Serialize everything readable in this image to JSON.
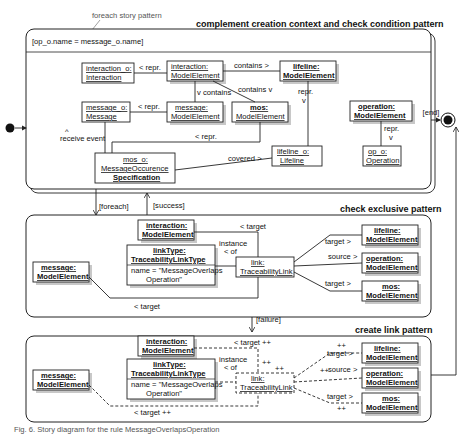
{
  "diagram": {
    "foreach_label": "foreach story pattern",
    "patterns": [
      {
        "id": "complement",
        "title": "complement creation context and check condition pattern",
        "condition": "[op_o.name = message_o.name]"
      },
      {
        "id": "check_exclusive",
        "title": "check exclusive pattern"
      },
      {
        "id": "create_link",
        "title": "create link pattern"
      }
    ],
    "transitions": {
      "foreach": "[foreach]",
      "success": "[success]",
      "failure": "[failure]",
      "end": "[end]"
    },
    "p1": {
      "nodes": {
        "interaction_o": {
          "name": "interaction_o:",
          "type": "Interaction"
        },
        "interaction_me": {
          "name": "interaction:",
          "type": "ModelElement"
        },
        "lifeline_me": {
          "name": "lifeline:",
          "type": "ModelElement"
        },
        "message_o": {
          "name": "message_o:",
          "type": "Message"
        },
        "message_me": {
          "name": "message:",
          "type": "ModelElement"
        },
        "mos_me": {
          "name": "mos:",
          "type": "ModelElement"
        },
        "operation_me": {
          "name": "operation:",
          "type": "ModelElement"
        },
        "op_o": {
          "name": "op_o:",
          "type": "Operation"
        },
        "mos_o": {
          "name": "mos_o:",
          "type": "MessageOccurence",
          "type2": "Specification"
        },
        "lifeline_o": {
          "name": "lifeline_o:",
          "type": "Lifeline"
        }
      },
      "edges": {
        "repr1": "< repr.",
        "contains1": "contains >",
        "contains2": "v contains",
        "contains3": "contains v",
        "repr2": "< repr.",
        "repr3": "repr.",
        "repr3_arrow": "v",
        "repr4": "repr.",
        "repr4_arrow": "v",
        "repr5": "< repr.",
        "receive_arrow": "^",
        "receive": "receive event",
        "covered": "covered >"
      }
    },
    "p2": {
      "nodes": {
        "interaction": {
          "name": "interaction:",
          "type": "ModelElement"
        },
        "message": {
          "name": "message:",
          "type": "ModelElement"
        },
        "linktype": {
          "name": "linkType:",
          "type": "TraceabilityLinkType",
          "attr": "name = \"MessageOverlaps",
          "attr2": "Operation\""
        },
        "link": {
          "name": "link:",
          "type": "TraceabilityLink"
        },
        "lifeline": {
          "name": "lifeline:",
          "type": "ModelElement"
        },
        "operation": {
          "name": "operation:",
          "type": "ModelElement"
        },
        "mos": {
          "name": "mos:",
          "type": "ModelElement"
        }
      },
      "edges": {
        "target_top": "< target",
        "instance_of": "instance",
        "instance_of2": "< of",
        "target_lifeline": "target >",
        "source_operation": "source >",
        "target_mos": "target >",
        "target_bottom": "< target"
      }
    },
    "p3": {
      "nodes": {
        "interaction": {
          "name": "interaction:",
          "type": "ModelElement"
        },
        "message": {
          "name": "message:",
          "type": "ModelElement"
        },
        "linktype": {
          "name": "linkType:",
          "type": "TraceabilityLinkType",
          "attr": "name = \"MessageOverlaps",
          "attr2": "Operation\""
        },
        "link": {
          "name": "link:",
          "type": "TraceabilityLink"
        },
        "lifeline": {
          "name": "lifeline:",
          "type": "ModelElement"
        },
        "operation": {
          "name": "operation:",
          "type": "ModelElement"
        },
        "mos": {
          "name": "mos:",
          "type": "ModelElement"
        }
      },
      "edges": {
        "target_top": "< target ++",
        "instance_of": "instance",
        "instance_of2": "< of",
        "plus_a": "++",
        "plus_b": "++",
        "target_lifeline": "target >",
        "plus_c": "++",
        "source_operation": "source >",
        "plus_d": "++",
        "target_mos": "target >",
        "plus_e": "++",
        "target_bottom": "< target  ++"
      }
    },
    "caption": "Fig. 6. Story diagram for the rule MessageOverlapsOperation"
  }
}
